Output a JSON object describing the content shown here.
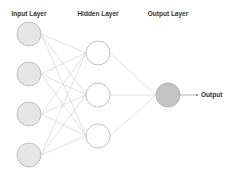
{
  "diagram": {
    "type": "neural-network",
    "layers": [
      {
        "label": "Input Layer",
        "x": 29,
        "nodes": [
          34,
          74,
          114,
          155
        ],
        "fill": "#e6e6e6",
        "stroke": "#b3b3b3"
      },
      {
        "label": "Hidden Layer",
        "x": 98,
        "nodes": [
          53,
          95,
          136
        ],
        "fill": "#ffffff",
        "stroke": "#b3b3b3"
      },
      {
        "label": "Output Layer",
        "x": 168,
        "nodes": [
          95
        ],
        "fill": "#c4c4c4",
        "stroke": "#a8a8a8"
      }
    ],
    "node_radius": 12,
    "edge_color": "#cfcfcf",
    "output_arrow": {
      "label": "Output",
      "from_x": 180,
      "to_x": 198,
      "y": 95
    }
  },
  "labels": {
    "input": "Input Layer",
    "hidden": "Hidden Layer",
    "output": "Output Layer",
    "output_arrow": "Output"
  }
}
